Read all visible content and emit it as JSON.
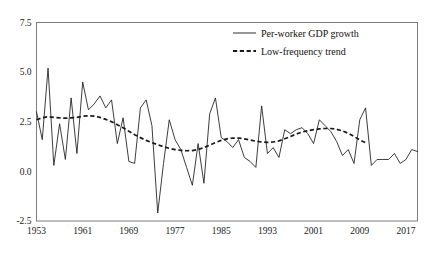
{
  "chart_data": {
    "type": "line",
    "title": "",
    "xlabel": "",
    "ylabel": "",
    "xlim": [
      1953,
      2019
    ],
    "ylim": [
      -2.5,
      7.5
    ],
    "grid": false,
    "legend_position": "top-right",
    "xticks": [
      "1953",
      "1961",
      "1969",
      "1977",
      "1985",
      "1993",
      "2001",
      "2009",
      "2017"
    ],
    "xtick_values": [
      1953,
      1961,
      1969,
      1977,
      1985,
      1993,
      2001,
      2009,
      2017
    ],
    "yticks": [
      "7.5",
      "5.0",
      "2.5",
      "0.0",
      "-2.5"
    ],
    "ytick_values": [
      7.5,
      5.0,
      2.5,
      0.0,
      -2.5
    ],
    "x": [
      1953,
      1954,
      1955,
      1956,
      1957,
      1958,
      1959,
      1960,
      1961,
      1962,
      1963,
      1964,
      1965,
      1966,
      1967,
      1968,
      1969,
      1970,
      1971,
      1972,
      1973,
      1974,
      1975,
      1976,
      1977,
      1978,
      1979,
      1980,
      1981,
      1982,
      1983,
      1984,
      1985,
      1986,
      1987,
      1988,
      1989,
      1990,
      1991,
      1992,
      1993,
      1994,
      1995,
      1996,
      1997,
      1998,
      1999,
      2000,
      2001,
      2002,
      2003,
      2004,
      2005,
      2006,
      2007,
      2008,
      2009,
      2010,
      2011,
      2012,
      2013,
      2014,
      2015,
      2016,
      2017,
      2018,
      2019
    ],
    "series": [
      {
        "name": "Per-worker GDP growth",
        "style": "solid",
        "values": [
          3.0,
          1.6,
          5.2,
          0.3,
          2.4,
          0.6,
          3.7,
          0.9,
          4.5,
          3.1,
          3.4,
          3.8,
          3.2,
          3.6,
          1.4,
          2.7,
          0.5,
          0.4,
          3.2,
          3.6,
          2.3,
          -2.1,
          0.4,
          2.6,
          1.6,
          1.1,
          0.2,
          -0.7,
          1.4,
          -0.6,
          2.9,
          3.7,
          1.7,
          1.5,
          1.2,
          1.6,
          0.7,
          0.5,
          0.2,
          3.3,
          0.9,
          1.2,
          0.7,
          2.1,
          1.9,
          2.1,
          2.2,
          1.9,
          1.4,
          2.6,
          2.3,
          2.0,
          1.5,
          0.8,
          1.1,
          0.4,
          2.6,
          3.2,
          0.3,
          0.6,
          0.6,
          0.6,
          0.9,
          0.4,
          0.6,
          1.1,
          1.0
        ]
      },
      {
        "name": "Low-frequency trend",
        "style": "dashed",
        "values": [
          2.6,
          2.7,
          2.75,
          2.72,
          2.7,
          2.68,
          2.7,
          2.72,
          2.78,
          2.8,
          2.78,
          2.72,
          2.62,
          2.5,
          2.35,
          2.2,
          2.02,
          1.85,
          1.7,
          1.56,
          1.45,
          1.34,
          1.24,
          1.16,
          1.1,
          1.06,
          1.04,
          1.05,
          1.1,
          1.2,
          1.32,
          1.45,
          1.56,
          1.64,
          1.68,
          1.68,
          1.64,
          1.58,
          1.52,
          1.48,
          1.46,
          1.48,
          1.54,
          1.64,
          1.76,
          1.88,
          1.98,
          2.05,
          2.1,
          2.14,
          2.16,
          2.16,
          2.12,
          2.04,
          1.92,
          1.76,
          1.58,
          1.44,
          null,
          null,
          null,
          null,
          null,
          null,
          null,
          null,
          null
        ]
      }
    ]
  },
  "legend": {
    "items": [
      {
        "label": "Per-worker GDP growth",
        "style": "solid"
      },
      {
        "label": "Low-frequency trend",
        "style": "dashed"
      }
    ]
  }
}
